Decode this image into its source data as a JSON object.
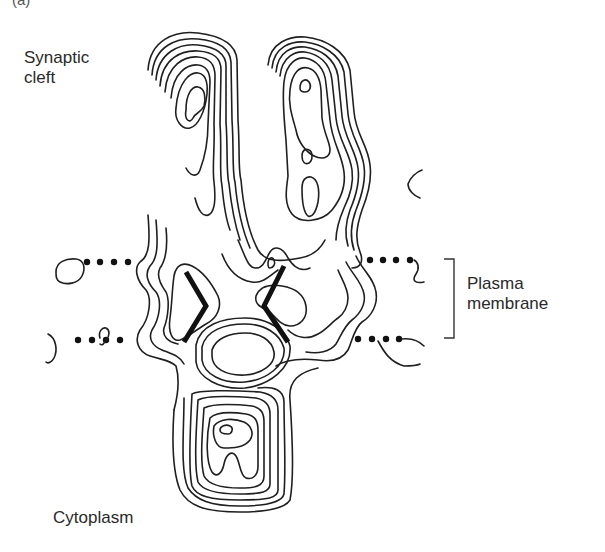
{
  "figure": {
    "panel_label": "(a)",
    "labels": {
      "synaptic_cleft": "Synaptic\ncleft",
      "plasma_membrane": "Plasma\nmembrane",
      "cytoplasm": "Cytoplasm"
    },
    "elements": {
      "membrane_boundary_dots_per_side": 4,
      "transmembrane_helices": 2
    }
  }
}
